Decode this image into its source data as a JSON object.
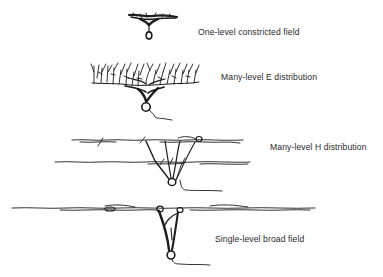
{
  "figure": {
    "panels": [
      {
        "id": "one-level-constricted",
        "label": "One-level constricted field"
      },
      {
        "id": "many-level-e",
        "label": "Many-level E distribution"
      },
      {
        "id": "many-level-h",
        "label": "Many-level H distribution"
      },
      {
        "id": "single-level-broad",
        "label": "Single-level broad field"
      }
    ],
    "colors": {
      "ink": "#1c1c1c",
      "text": "#2a2a2a",
      "background": "#ffffff"
    }
  }
}
